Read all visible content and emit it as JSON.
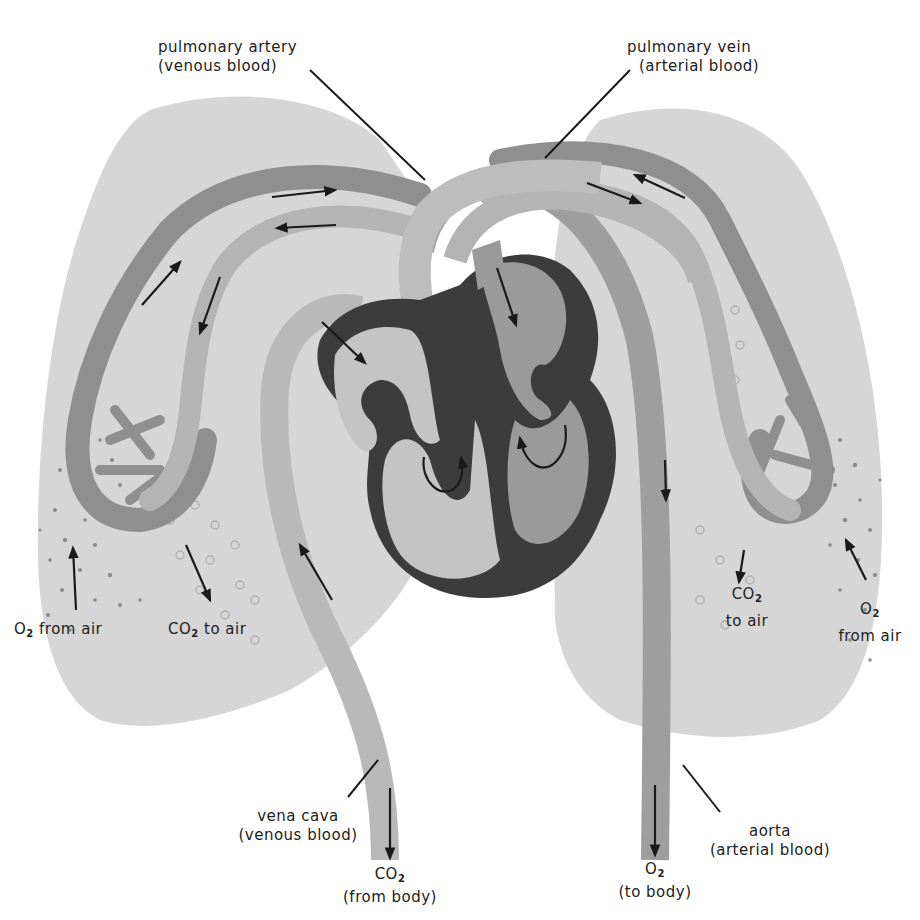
{
  "diagram": {
    "colors": {
      "background": "#ffffff",
      "lung": "#d6d6d6",
      "venous_vessel": "#8f8f8f",
      "arterial_vessel": "#b4b4b4",
      "heart_wall": "#3c3c3c",
      "right_heart_chamber": "#c4c4c4",
      "left_heart_chamber": "#9a9a9a",
      "arrow": "#1a1a1a",
      "text": "#222222"
    },
    "labels": {
      "pulmonary_artery": {
        "name": "pulmonary artery",
        "note": "(venous blood)"
      },
      "pulmonary_vein": {
        "name": "pulmonary vein",
        "note": "(arterial blood)"
      },
      "vena_cava": {
        "name": "vena cava",
        "note": "(venous blood)"
      },
      "aorta": {
        "name": "aorta",
        "note": "(arterial blood)"
      },
      "left_o2": {
        "chem": "O",
        "sub": "2",
        "text": " from air"
      },
      "left_co2": {
        "chem": "CO",
        "sub": "2",
        "text": " to air"
      },
      "right_co2": {
        "chem": "CO",
        "sub": "2",
        "text": "to air"
      },
      "right_o2": {
        "chem": "O",
        "sub": "2",
        "text": "from air"
      },
      "co2_body": {
        "chem": "CO",
        "sub": "2",
        "text": "(from body)"
      },
      "o2_body": {
        "chem": "O",
        "sub": "2",
        "text": "(to body)"
      }
    },
    "structures": [
      "left lung",
      "right lung",
      "heart",
      "right atrium",
      "right ventricle",
      "left atrium",
      "left ventricle",
      "pulmonary artery",
      "pulmonary vein",
      "vena cava",
      "aorta",
      "capillary network"
    ]
  }
}
